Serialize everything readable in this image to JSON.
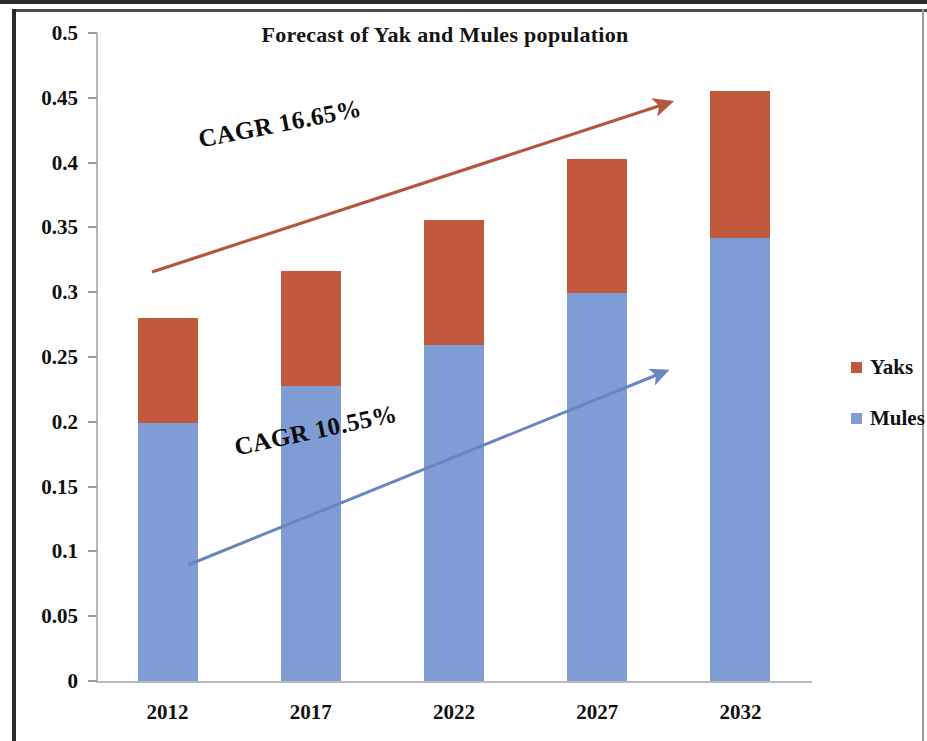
{
  "chart_data": {
    "type": "bar",
    "subtype": "stacked-column",
    "title": "Forecast of Yak and Mules population",
    "xlabel": "",
    "ylabel": "",
    "categories": [
      "2012",
      "2017",
      "2022",
      "2027",
      "2032"
    ],
    "series": [
      {
        "name": "Mules",
        "color": "#7f9cd5",
        "values": [
          0.199,
          0.228,
          0.259,
          0.299,
          0.342
        ]
      },
      {
        "name": "Yaks",
        "color": "#c15a3d",
        "values": [
          0.081,
          0.088,
          0.097,
          0.104,
          0.113
        ]
      }
    ],
    "totals": [
      0.28,
      0.316,
      0.356,
      0.403,
      0.4545
    ],
    "ylim": [
      0,
      0.5
    ],
    "ytick_step": 0.05,
    "ytick_labels": [
      "0.5",
      "0.45",
      "0.4",
      "0.35",
      "0.3",
      "0.25",
      "0.2",
      "0.15",
      "0.1",
      "0.05",
      "0"
    ],
    "ytick_values": [
      0.5,
      0.45,
      0.4,
      0.35,
      0.3,
      0.25,
      0.2,
      0.15,
      0.1,
      0.05,
      0
    ],
    "grid": false,
    "legend_position": "right",
    "annotations": [
      {
        "id": "cagr-yaks",
        "text": "CAGR 16.65%",
        "rate": "16.65%",
        "series": "Yaks",
        "arrow_color": "#b4573f"
      },
      {
        "id": "cagr-mules",
        "text": "CAGR 10.55%",
        "rate": "10.55%",
        "series": "Mules",
        "arrow_color": "#6a86bf"
      }
    ]
  },
  "legend": {
    "items": [
      {
        "label": "Yaks",
        "color": "#c15a3d"
      },
      {
        "label": "Mules",
        "color": "#7f9cd5"
      }
    ]
  }
}
